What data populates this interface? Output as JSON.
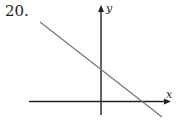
{
  "problem": {
    "number": "20."
  },
  "graph": {
    "axes": {
      "x_label": "x",
      "y_label": "y"
    },
    "line": {
      "description": "straight line with negative slope, positive y-intercept and positive x-intercept"
    },
    "colors": {
      "axes": "#222222",
      "line": "#777777"
    }
  }
}
